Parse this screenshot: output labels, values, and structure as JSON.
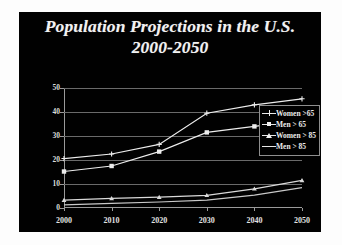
{
  "slide": {
    "title_line1": "Population Projections in the U.S.",
    "title_line2": "2000-2050",
    "background_color": "#010101",
    "text_color": "#f2f2f2",
    "frame_color": "#ffffff"
  },
  "chart_data": {
    "type": "line",
    "title": "Population Projections in the U.S. 2000-2050",
    "xlabel": "",
    "ylabel": "Population in millions",
    "categories": [
      "2000",
      "2010",
      "2020",
      "2030",
      "2040",
      "2050"
    ],
    "x": [
      2000,
      2010,
      2020,
      2030,
      2040,
      2050
    ],
    "ylim": [
      0,
      50
    ],
    "xlim": [
      2000,
      2050
    ],
    "yticks": [
      0,
      10,
      20,
      30,
      40,
      50
    ],
    "grid": true,
    "legend_position": "right",
    "series": [
      {
        "name": "Women >65",
        "marker": "plus",
        "color": "#ededed",
        "values": [
          20.6,
          22.5,
          26.5,
          39.5,
          43.0,
          45.5
        ]
      },
      {
        "name": "Men > 65",
        "marker": "square",
        "color": "#ededed",
        "values": [
          15.2,
          17.5,
          23.5,
          31.5,
          34.0,
          36.5
        ]
      },
      {
        "name": "Women > 85",
        "marker": "triangle",
        "color": "#dadada",
        "values": [
          3.3,
          4.0,
          4.5,
          5.3,
          8.0,
          11.5
        ]
      },
      {
        "name": "Men > 85",
        "marker": "none",
        "color": "#c9c9c9",
        "values": [
          1.3,
          1.9,
          2.5,
          3.3,
          5.4,
          8.5
        ]
      }
    ]
  },
  "legend": {
    "items": [
      {
        "label": "Women >65",
        "marker": "plus"
      },
      {
        "label": "Men > 65",
        "marker": "square"
      },
      {
        "label": "Women > 85",
        "marker": "triangle"
      },
      {
        "label": "Men > 85",
        "marker": "none"
      }
    ]
  }
}
